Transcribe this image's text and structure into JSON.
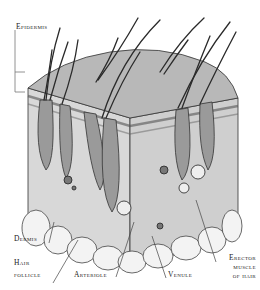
{
  "diagram": {
    "labels": {
      "epidermis": "Epidermis",
      "dermis": "Dermis",
      "hair_follicle_1": "Hair",
      "hair_follicle_2": "follicle",
      "arteriole": "Arteriole",
      "venule": "Venule",
      "erector_1": "Erector",
      "erector_2": "muscle",
      "erector_3": "of hair"
    },
    "colors": {
      "ink": "#2a2a2a",
      "skin_top": "#b9b9b9",
      "dermis": "#dcdcdc",
      "fat": "#f2f2f2",
      "follicle": "#8c8c8c"
    }
  }
}
